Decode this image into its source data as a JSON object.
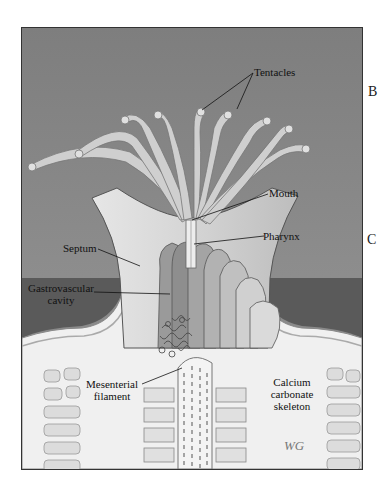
{
  "figure": {
    "labels": {
      "tentacles": "Tentacles",
      "mouth": "Mouth",
      "pharynx": "Pharynx",
      "septum": "Septum",
      "gastrovascular_1": "Gastrovascular",
      "gastrovascular_2": "cavity",
      "mesenterial_1": "Mesenterial",
      "mesenterial_2": "filament",
      "calcium_1": "Calcium",
      "calcium_2": "carbonate",
      "calcium_3": "skeleton"
    },
    "side_letters": [
      "B",
      "C"
    ],
    "signature": "WG"
  },
  "colors": {
    "background": "#8c8c8c",
    "dark_water": "#5c5c5c",
    "tissue": "#c8c8c8",
    "tissue_light": "#e2e2e2",
    "skeleton": "#eeeeee",
    "line": "#222222"
  }
}
